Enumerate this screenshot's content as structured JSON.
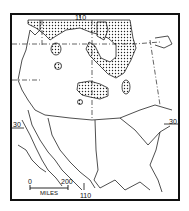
{
  "map": {
    "title": "",
    "longitude_top": "110",
    "longitude_bottom": "110",
    "latitude_left": "30",
    "latitude_right": "30",
    "scale_bar": {
      "start": "0",
      "end": "200",
      "unit": "MILES"
    },
    "shaded_pattern": "stippled",
    "colors": {
      "ink": "#111111",
      "background": "#ffffff"
    }
  }
}
